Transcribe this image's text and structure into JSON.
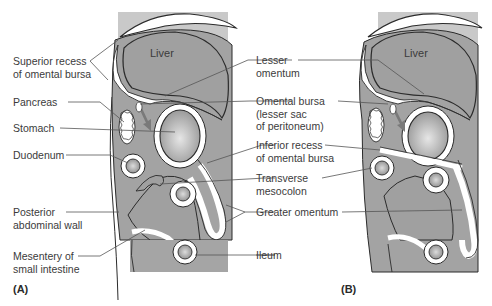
{
  "figure": {
    "panels": [
      {
        "id": "A",
        "label": "(A)"
      },
      {
        "id": "B",
        "label": "(B)"
      }
    ],
    "organ_labels": {
      "liver_A": "Liver",
      "liver_B": "Liver"
    },
    "left_labels": [
      {
        "id": "superior-recess",
        "line1": "Superior recess",
        "line2": "of omental bursa"
      },
      {
        "id": "pancreas",
        "line1": "Pancreas"
      },
      {
        "id": "stomach",
        "line1": "Stomach"
      },
      {
        "id": "duodenum",
        "line1": "Duodenum"
      },
      {
        "id": "posterior-abdominal-wall",
        "line1": "Posterior",
        "line2": "abdominal wall"
      },
      {
        "id": "mesentery",
        "line1": "Mesentery of",
        "line2": "small intestine"
      }
    ],
    "center_labels": [
      {
        "id": "lesser-omentum",
        "line1": "Lesser",
        "line2": "omentum"
      },
      {
        "id": "omental-bursa",
        "line1": "Omental bursa",
        "line2": "(lesser sac",
        "line3": "of peritoneum)"
      },
      {
        "id": "inferior-recess",
        "line1": "Inferior recess",
        "line2": "of omental bursa"
      },
      {
        "id": "transverse-mesocolon",
        "line1": "Transverse",
        "line2": "mesocolon"
      },
      {
        "id": "greater-omentum",
        "line1": "Greater omentum"
      },
      {
        "id": "ileum",
        "line1": "Ileum"
      }
    ],
    "colors": {
      "background": "#ffffff",
      "panel_bg": "#c9c9c9",
      "organ_fill": "#9e9e9e",
      "membrane": "#ffffff",
      "outline": "#2b2b2b",
      "leader": "#555555",
      "arrow": "#7a7a7a"
    }
  }
}
